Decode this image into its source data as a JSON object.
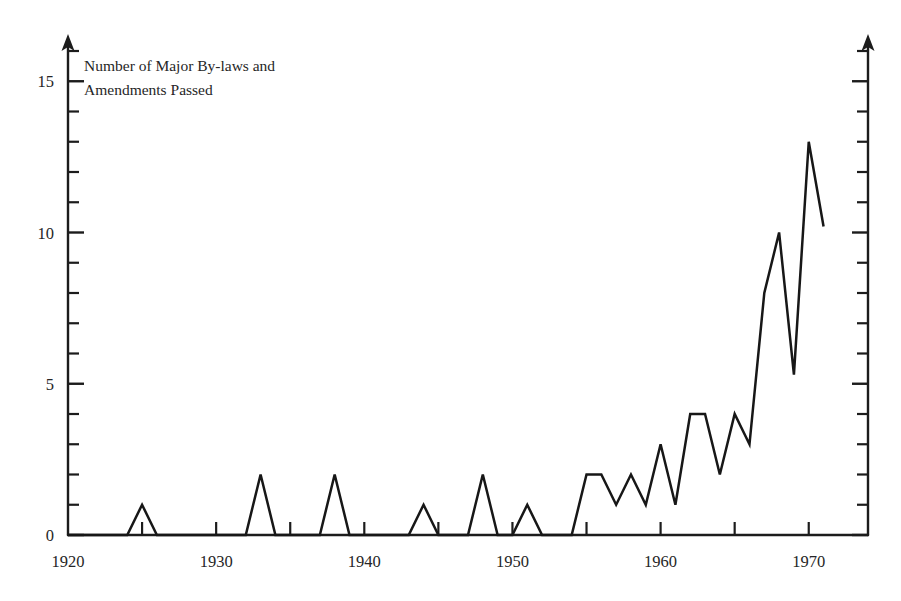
{
  "figure": {
    "annotation_line1": "Number of Major By-laws and",
    "annotation_line2": "Amendments Passed"
  },
  "axes": {
    "y_tick_labels": [
      "0",
      "5",
      "10",
      "15"
    ],
    "y_tick_values": [
      0,
      5,
      10,
      15
    ],
    "x_tick_labels": [
      "1920",
      "1930",
      "1940",
      "1950",
      "1960",
      "1970"
    ],
    "x_tick_values": [
      1920,
      1930,
      1940,
      1950,
      1960,
      1970
    ]
  },
  "chart_data": {
    "type": "line",
    "title": "Number of Major By-laws and Amendments Passed",
    "xlabel": "",
    "ylabel": "Number of Major By-laws and Amendments Passed",
    "xlim": [
      1920,
      1974
    ],
    "ylim": [
      0,
      16
    ],
    "grid": false,
    "legend": false,
    "x_major_ticks": [
      1920,
      1925,
      1930,
      1935,
      1940,
      1945,
      1950,
      1955,
      1960,
      1965,
      1970
    ],
    "x_labeled_ticks": [
      1920,
      1930,
      1940,
      1950,
      1960,
      1970
    ],
    "y_major_ticks": [
      0,
      1,
      2,
      3,
      4,
      5,
      6,
      7,
      8,
      9,
      10,
      11,
      12,
      13,
      14,
      15,
      16
    ],
    "y_labeled_ticks": [
      0,
      5,
      10,
      15
    ],
    "x": [
      1920,
      1921,
      1922,
      1923,
      1924,
      1925,
      1926,
      1927,
      1928,
      1929,
      1930,
      1931,
      1932,
      1933,
      1934,
      1935,
      1936,
      1937,
      1938,
      1939,
      1940,
      1941,
      1942,
      1943,
      1944,
      1945,
      1946,
      1947,
      1948,
      1949,
      1950,
      1951,
      1952,
      1953,
      1954,
      1955,
      1956,
      1957,
      1958,
      1959,
      1960,
      1961,
      1962,
      1963,
      1964,
      1965,
      1966,
      1967,
      1968,
      1969,
      1970,
      1971
    ],
    "values": [
      0,
      0,
      0,
      0,
      0,
      1,
      0,
      0,
      0,
      0,
      0,
      0,
      0,
      2,
      0,
      0,
      0,
      0,
      2,
      0,
      0,
      0,
      0,
      0,
      1,
      0,
      0,
      0,
      2,
      0,
      0,
      1,
      0,
      0,
      0,
      2,
      2,
      1,
      2,
      1,
      3,
      1,
      4,
      4,
      2,
      4,
      3,
      8,
      10,
      5.3,
      13,
      10.2
    ],
    "series_name": "Major by-laws and amendments passed"
  }
}
